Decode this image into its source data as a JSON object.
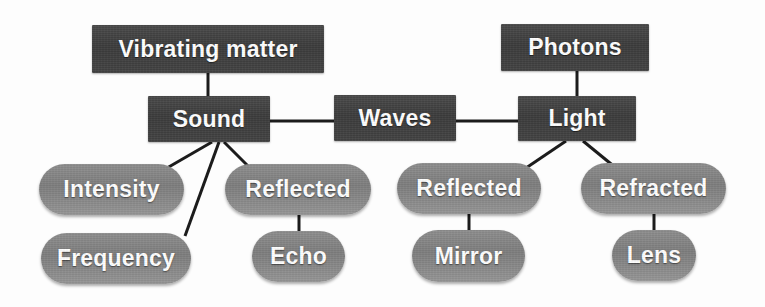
{
  "diagram": {
    "type": "concept-map",
    "colors": {
      "background": "#fdfdfd",
      "box_fill": "#3f3f3f",
      "pill_fill": "#858585",
      "text": "#ffffff",
      "edge": "#1c1c1c"
    },
    "nodes": [
      {
        "id": "vibrating-matter",
        "label": "Vibrating matter",
        "shape": "rect",
        "x": 92,
        "y": 25,
        "w": 232,
        "h": 48,
        "font_size": 23
      },
      {
        "id": "photons",
        "label": "Photons",
        "shape": "rect",
        "x": 501,
        "y": 24,
        "w": 148,
        "h": 47,
        "font_size": 23
      },
      {
        "id": "sound",
        "label": "Sound",
        "shape": "rect",
        "x": 148,
        "y": 96,
        "w": 122,
        "h": 46,
        "font_size": 23
      },
      {
        "id": "waves",
        "label": "Waves",
        "shape": "rect",
        "x": 334,
        "y": 95,
        "w": 122,
        "h": 46,
        "font_size": 23
      },
      {
        "id": "light",
        "label": "Light",
        "shape": "rect",
        "x": 518,
        "y": 96,
        "w": 118,
        "h": 45,
        "font_size": 23
      },
      {
        "id": "intensity",
        "label": "Intensity",
        "shape": "pill",
        "x": 39,
        "y": 164,
        "w": 145,
        "h": 51,
        "font_size": 23
      },
      {
        "id": "frequency",
        "label": "Frequency",
        "shape": "pill",
        "x": 41,
        "y": 233,
        "w": 150,
        "h": 51,
        "font_size": 23
      },
      {
        "id": "sound-reflected",
        "label": "Reflected",
        "shape": "pill",
        "x": 225,
        "y": 164,
        "w": 146,
        "h": 51,
        "font_size": 23
      },
      {
        "id": "echo",
        "label": "Echo",
        "shape": "pill",
        "x": 252,
        "y": 231,
        "w": 93,
        "h": 51,
        "font_size": 23
      },
      {
        "id": "light-reflected",
        "label": "Reflected",
        "shape": "pill",
        "x": 397,
        "y": 163,
        "w": 144,
        "h": 51,
        "font_size": 23
      },
      {
        "id": "mirror",
        "label": "Mirror",
        "shape": "pill",
        "x": 412,
        "y": 230,
        "w": 113,
        "h": 52,
        "font_size": 23
      },
      {
        "id": "refracted",
        "label": "Refracted",
        "shape": "pill",
        "x": 581,
        "y": 163,
        "w": 145,
        "h": 51,
        "font_size": 23
      },
      {
        "id": "lens",
        "label": "Lens",
        "shape": "pill",
        "x": 612,
        "y": 230,
        "w": 84,
        "h": 51,
        "font_size": 23
      }
    ],
    "edges": [
      {
        "id": "edge-vibrating-sound",
        "from": "vibrating-matter",
        "to": "sound",
        "x1": 208,
        "y1": 73,
        "x2": 208,
        "y2": 96,
        "width": 3
      },
      {
        "id": "edge-photons-light",
        "from": "photons",
        "to": "light",
        "x1": 577,
        "y1": 71,
        "x2": 577,
        "y2": 96,
        "width": 3
      },
      {
        "id": "edge-sound-waves",
        "from": "sound",
        "to": "waves",
        "x1": 270,
        "y1": 121,
        "x2": 334,
        "y2": 121,
        "width": 3
      },
      {
        "id": "edge-waves-light",
        "from": "waves",
        "to": "light",
        "x1": 456,
        "y1": 121,
        "x2": 518,
        "y2": 121,
        "width": 3
      },
      {
        "id": "edge-sound-intensity",
        "from": "sound",
        "to": "intensity",
        "x1": 212,
        "y1": 142,
        "x2": 167,
        "y2": 168,
        "width": 3
      },
      {
        "id": "edge-sound-frequency",
        "from": "sound",
        "to": "frequency",
        "x1": 219,
        "y1": 142,
        "x2": 185,
        "y2": 236,
        "width": 3
      },
      {
        "id": "edge-sound-reflected",
        "from": "sound",
        "to": "sound-reflected",
        "x1": 224,
        "y1": 142,
        "x2": 251,
        "y2": 169,
        "width": 3
      },
      {
        "id": "edge-reflected-echo",
        "from": "sound-reflected",
        "to": "echo",
        "x1": 299,
        "y1": 214,
        "x2": 299,
        "y2": 232,
        "width": 3
      },
      {
        "id": "edge-light-reflected",
        "from": "light",
        "to": "light-reflected",
        "x1": 566,
        "y1": 141,
        "x2": 526,
        "y2": 168,
        "width": 3
      },
      {
        "id": "edge-light-refracted",
        "from": "light",
        "to": "refracted",
        "x1": 583,
        "y1": 141,
        "x2": 616,
        "y2": 168,
        "width": 3
      },
      {
        "id": "edge-reflected-mirror",
        "from": "light-reflected",
        "to": "mirror",
        "x1": 469,
        "y1": 213,
        "x2": 469,
        "y2": 231,
        "width": 3
      },
      {
        "id": "edge-refracted-lens",
        "from": "refracted",
        "to": "lens",
        "x1": 654,
        "y1": 213,
        "x2": 654,
        "y2": 231,
        "width": 3
      }
    ]
  }
}
